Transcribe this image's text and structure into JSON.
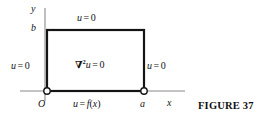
{
  "figure": {
    "caption": "FIGURE 37",
    "axes": {
      "y_label": "y",
      "x_label": "x",
      "origin_label": "O",
      "x_tick_label": "a",
      "y_tick_label": "b"
    },
    "boundary_conditions": {
      "top": "u = 0",
      "left": "u = 0",
      "right": "u = 0",
      "bottom": "u = f(x)"
    },
    "interior_equation": "∇2u = 0",
    "colors": {
      "background": "#ffffff",
      "rectangle_stroke": "#141414",
      "axis_stroke": "#7d7d7d",
      "text": "#141414",
      "node_fill": "#ffffff"
    },
    "geometry": {
      "rect_left": 47,
      "rect_top": 30,
      "rect_right": 144,
      "rect_bottom": 91,
      "y_axis_x": 45,
      "x_axis_y": 91
    }
  }
}
